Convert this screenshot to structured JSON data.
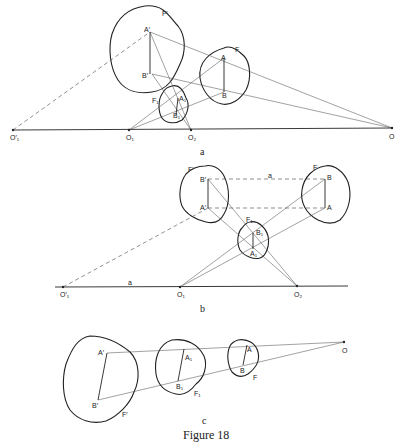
{
  "figure": {
    "caption": "Figure 18",
    "panels": [
      {
        "id": "a",
        "caption": "a",
        "labels": {
          "F_prime": "F′",
          "A_prime": "A′",
          "B_prime": "B′",
          "F": "F",
          "A": "A",
          "B": "B",
          "F1": "F₁",
          "A1": "A₁",
          "B1": "B₁",
          "O1_prime": "O′₁",
          "O1": "O₁",
          "O2": "O₂",
          "O": "O"
        }
      },
      {
        "id": "b",
        "caption": "b",
        "labels": {
          "F_prime": "F′",
          "B_prime": "B′",
          "A_prime": "A′",
          "F": "F",
          "B": "B",
          "A": "A",
          "F1": "F₁",
          "B1": "B₁",
          "A1": "A₁",
          "line_a_top": "a",
          "line_a_bottom": "a",
          "O1_prime": "O′₁",
          "O1": "O₁",
          "O2": "O₂"
        }
      },
      {
        "id": "c",
        "caption": "c",
        "labels": {
          "A_prime": "A′",
          "B_prime": "B′",
          "F_prime": "F′",
          "A1": "A₁",
          "B1": "B₁",
          "F1": "F₁",
          "A": "A",
          "B": "B",
          "F": "F",
          "O": "O"
        }
      }
    ]
  }
}
